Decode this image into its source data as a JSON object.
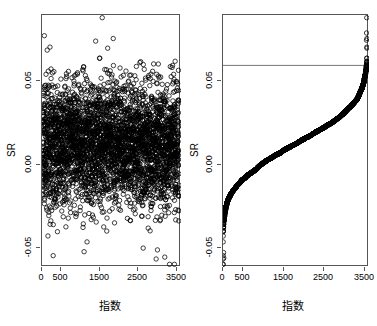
{
  "figure": {
    "background": "#ffffff",
    "point_color": "#000000",
    "axis_color": "#555555",
    "refline_color": "#666666",
    "width": 377,
    "height": 326,
    "panels": 2
  },
  "chart_data": [
    {
      "type": "scatter",
      "panel": "left",
      "title": "",
      "xlabel": "指数",
      "ylabel": "SR",
      "xlim": [
        0,
        3600
      ],
      "ylim": [
        -0.068,
        0.072
      ],
      "xticks": [
        0,
        500,
        1500,
        2500,
        3500
      ],
      "xtick_labels": [
        "0",
        "500",
        "1500",
        "2500",
        "3500"
      ],
      "yticks": [
        -0.05,
        0.0,
        0.05
      ],
      "ytick_labels": [
        "-0.05",
        "0.00",
        "0.05"
      ],
      "grid": false,
      "legend": null,
      "n_points": 3550,
      "marker": "open-circle",
      "marker_size": 2.2,
      "description": "Unsorted standardized residuals SR plotted against observation index; dense horizontal cloud centred near 0.00 spanning roughly -0.05 to 0.05 with scattered outliers.",
      "distribution": {
        "mean": 0.0,
        "sd": 0.0175,
        "x_min": 1,
        "x_max": 3550
      },
      "notable_outliers": [
        {
          "x": 1560,
          "y": 0.0705
        },
        {
          "x": 60,
          "y": 0.0605
        },
        {
          "x": 1390,
          "y": 0.0575
        },
        {
          "x": 135,
          "y": 0.0525
        },
        {
          "x": 1090,
          "y": -0.0595
        },
        {
          "x": 2990,
          "y": -0.0585
        },
        {
          "x": 3180,
          "y": -0.0625
        },
        {
          "x": 2620,
          "y": -0.0575
        }
      ]
    },
    {
      "type": "line",
      "panel": "right",
      "title": "",
      "xlabel": "指数",
      "ylabel": "SR",
      "xlim": [
        0,
        3600
      ],
      "ylim": [
        -0.068,
        0.072
      ],
      "xticks": [
        0,
        500,
        1500,
        2500,
        3500
      ],
      "xtick_labels": [
        "0",
        "500",
        "1500",
        "2500",
        "3500"
      ],
      "yticks": [
        -0.05,
        0.0,
        0.05
      ],
      "ytick_labels": [
        "-0.05",
        "0.00",
        "0.05"
      ],
      "grid": false,
      "legend": null,
      "marker": "open-circle",
      "marker_size": 2.2,
      "description": "Same SR values sorted ascending against rank index, forming a normal-quantile sigmoid curve; a horizontal reference line is drawn near the upper tail.",
      "reference_line": {
        "orientation": "horizontal",
        "y": 0.044,
        "color": "#666666"
      },
      "sorted_curve_points": [
        {
          "x": 5,
          "y": -0.063
        },
        {
          "x": 15,
          "y": -0.059
        },
        {
          "x": 30,
          "y": -0.0545
        },
        {
          "x": 45,
          "y": -0.05
        },
        {
          "x": 70,
          "y": -0.045
        },
        {
          "x": 110,
          "y": -0.0405
        },
        {
          "x": 160,
          "y": -0.037
        },
        {
          "x": 230,
          "y": -0.0335
        },
        {
          "x": 320,
          "y": -0.03
        },
        {
          "x": 440,
          "y": -0.0265
        },
        {
          "x": 580,
          "y": -0.023
        },
        {
          "x": 740,
          "y": -0.0195
        },
        {
          "x": 920,
          "y": -0.016
        },
        {
          "x": 1110,
          "y": -0.0125
        },
        {
          "x": 1310,
          "y": -0.009
        },
        {
          "x": 1500,
          "y": -0.0055
        },
        {
          "x": 1700,
          "y": -0.002
        },
        {
          "x": 1880,
          "y": 0.0015
        },
        {
          "x": 2060,
          "y": 0.005
        },
        {
          "x": 2240,
          "y": 0.0085
        },
        {
          "x": 2420,
          "y": 0.012
        },
        {
          "x": 2600,
          "y": 0.0155
        },
        {
          "x": 2770,
          "y": 0.019
        },
        {
          "x": 2930,
          "y": 0.0225
        },
        {
          "x": 3080,
          "y": 0.026
        },
        {
          "x": 3210,
          "y": 0.0295
        },
        {
          "x": 3320,
          "y": 0.033
        },
        {
          "x": 3410,
          "y": 0.037
        },
        {
          "x": 3470,
          "y": 0.041
        },
        {
          "x": 3505,
          "y": 0.045
        },
        {
          "x": 3525,
          "y": 0.049
        },
        {
          "x": 3538,
          "y": 0.053
        },
        {
          "x": 3545,
          "y": 0.057
        },
        {
          "x": 3548,
          "y": 0.0605
        }
      ],
      "tail_outliers": [
        {
          "x": 3545,
          "y": 0.0705
        },
        {
          "x": 3540,
          "y": 0.062
        },
        {
          "x": 3538,
          "y": 0.058
        },
        {
          "x": 20,
          "y": -0.063
        },
        {
          "x": 14,
          "y": -0.06
        }
      ]
    }
  ]
}
